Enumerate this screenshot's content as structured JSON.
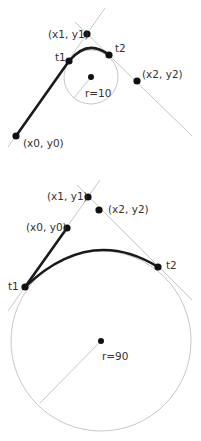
{
  "diagrams": [
    {
      "title": "arcTo small radius",
      "radius_label": "r=10",
      "points": {
        "p0": {
          "label": "(x0, y0)"
        },
        "p1": {
          "label": "(x1, y1)"
        },
        "p2": {
          "label": "(x2, y2)"
        },
        "t1": {
          "label": "t1"
        },
        "t2": {
          "label": "t2"
        }
      }
    },
    {
      "title": "arcTo large radius",
      "radius_label": "r=90",
      "points": {
        "p0": {
          "label": "(x0, y0)"
        },
        "p1": {
          "label": "(x1, y1)"
        },
        "p2": {
          "label": "(x2, y2)"
        },
        "t1": {
          "label": "t1"
        },
        "t2": {
          "label": "t2"
        }
      }
    }
  ],
  "colors": {
    "path": "#1a1a1a",
    "guide": "#c8c8c8",
    "text": "#333333"
  }
}
